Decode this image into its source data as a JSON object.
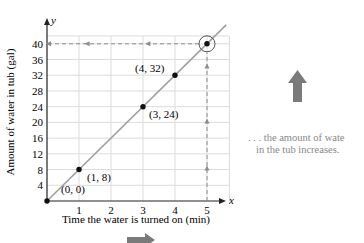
{
  "chart_data": {
    "type": "line",
    "title": "",
    "xlabel": "Time the water is turned on (min)",
    "ylabel": "Amount of water in tub (gal)",
    "x_axis_letter": "x",
    "y_axis_letter": "y",
    "x": [
      0,
      1,
      3,
      4,
      5
    ],
    "values": [
      0,
      8,
      24,
      32,
      40
    ],
    "points": [
      {
        "x": 0,
        "y": 0,
        "label": "(0, 0)"
      },
      {
        "x": 1,
        "y": 8,
        "label": "(1, 8)"
      },
      {
        "x": 3,
        "y": 24,
        "label": "(3, 24)"
      },
      {
        "x": 4,
        "y": 32,
        "label": "(4, 32)"
      },
      {
        "x": 5,
        "y": 40,
        "label": ""
      }
    ],
    "xticks": [
      "1",
      "2",
      "3",
      "4",
      "5"
    ],
    "yticks": [
      "4",
      "8",
      "12",
      "16",
      "20",
      "24",
      "28",
      "32",
      "36",
      "40"
    ],
    "xlim": [
      0,
      5.7
    ],
    "ylim": [
      0,
      43
    ],
    "grid": true,
    "legend": "none",
    "annotations": [
      "circled point at (5, 40)",
      "dashed vertical arrow from x = 5 up to the line",
      "dashed horizontal arrow from (5, 40) left to y-axis"
    ]
  },
  "side_note": {
    "line1": ". . . the amount of wate",
    "line2": "in the tub increases."
  },
  "colors": {
    "line": "#a0a0a0",
    "grid": "#dcdcdc",
    "dashed": "#8c8c8c",
    "point": "#111111",
    "arrow": "#7a7a7a"
  }
}
